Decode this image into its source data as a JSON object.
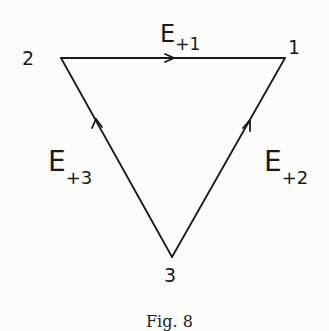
{
  "diagram": {
    "vertices": [
      {
        "id": "1",
        "label": "1",
        "x": 285,
        "y": 58
      },
      {
        "id": "2",
        "label": "2",
        "x": 61,
        "y": 58
      },
      {
        "id": "3",
        "label": "3",
        "x": 172,
        "y": 257
      }
    ],
    "edges": [
      {
        "from": "2",
        "to": "1",
        "label_main": "E",
        "label_sub": "+1"
      },
      {
        "from": "3",
        "to": "1",
        "label_main": "E",
        "label_sub": "+2"
      },
      {
        "from": "3",
        "to": "2",
        "label_main": "E",
        "label_sub": "+3"
      }
    ],
    "caption": "Fig. 8",
    "stroke_color": "#1a1a1a"
  }
}
